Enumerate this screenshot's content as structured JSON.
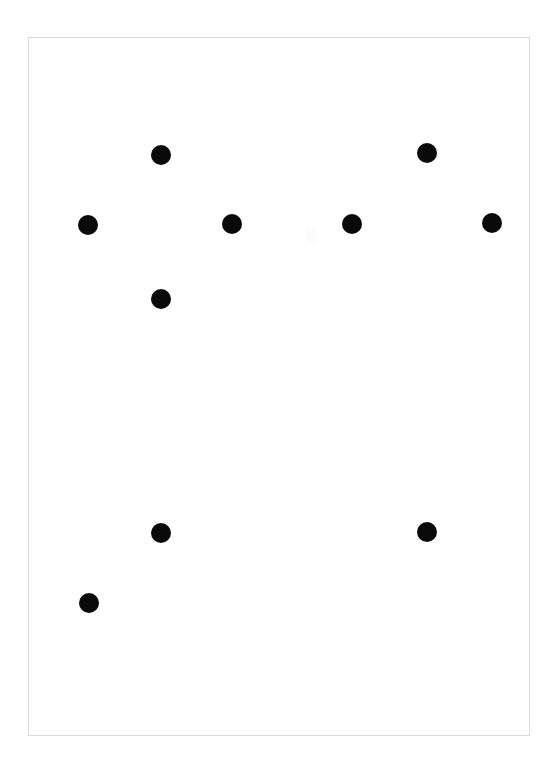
{
  "canvas": {
    "width": 558,
    "height": 774,
    "background_color": "#ffffff",
    "title": "Dot Pattern Canvas"
  },
  "frame": {
    "name": "border-frame",
    "x": 28,
    "y": 37,
    "width": 502,
    "height": 699,
    "border_color": "#d9d9d9",
    "border_width": 1,
    "fill_color": "#ffffff"
  },
  "chart_data": {
    "type": "scatter",
    "title": "",
    "subtitle": "",
    "xlabel": "",
    "ylabel": "",
    "xlim": [
      0,
      558
    ],
    "ylim": [
      0,
      774
    ],
    "grid": false,
    "legend": null,
    "marker": "circle",
    "marker_color": "#0a0a0a",
    "marker_diameter": 20,
    "point_count": 10,
    "points": [
      {
        "id": "dot-1",
        "label": "top-left",
        "x": 161,
        "y": 155,
        "d": 20
      },
      {
        "id": "dot-2",
        "label": "top-right",
        "x": 427,
        "y": 153,
        "d": 20
      },
      {
        "id": "dot-3",
        "label": "mid-far-left",
        "x": 88,
        "y": 225,
        "d": 20
      },
      {
        "id": "dot-4",
        "label": "mid-left",
        "x": 232,
        "y": 224,
        "d": 20
      },
      {
        "id": "dot-5",
        "label": "mid-right",
        "x": 352,
        "y": 224,
        "d": 20
      },
      {
        "id": "dot-6",
        "label": "mid-far-right",
        "x": 492,
        "y": 223,
        "d": 20
      },
      {
        "id": "dot-7",
        "label": "upper-lower-left",
        "x": 161,
        "y": 299,
        "d": 20
      },
      {
        "id": "dot-8",
        "label": "lower-left",
        "x": 161,
        "y": 533,
        "d": 20
      },
      {
        "id": "dot-9",
        "label": "lower-right",
        "x": 427,
        "y": 532,
        "d": 20
      },
      {
        "id": "dot-10",
        "label": "bottom-left",
        "x": 89,
        "y": 603,
        "d": 20
      }
    ]
  },
  "artifacts": [
    {
      "id": "faint-mark-1",
      "x": 306,
      "y": 228,
      "width": 10,
      "height": 14,
      "color": "#fcfcfc"
    }
  ]
}
